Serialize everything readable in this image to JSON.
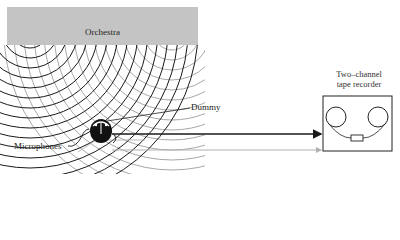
{
  "diagram": {
    "source": {
      "label": "Orchestra",
      "fill": "#c4c4c4"
    },
    "listener": {
      "label": "Dummy"
    },
    "sensors": {
      "label": "Microphones"
    },
    "recorder": {
      "title_line1": "Two–channel",
      "title_line2": "tape recorder"
    },
    "signals": [
      {
        "name": "left-channel",
        "color": "#1a1a1a"
      },
      {
        "name": "right-channel",
        "color": "#b0b0b0"
      }
    ],
    "wavefronts": [
      {
        "name": "left-source-waves",
        "color": "#1a1a1a"
      },
      {
        "name": "right-source-waves",
        "color": "#a8a8a8"
      }
    ]
  }
}
